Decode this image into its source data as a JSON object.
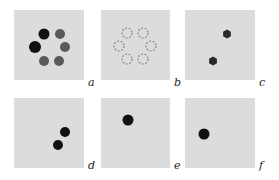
{
  "figure": {
    "background": "#ffffff",
    "panel_color": "#dcdcdc",
    "colors": {
      "dark": "#111111",
      "gray": "#5a5a5a",
      "outline": "#8a8a8a"
    },
    "panels": [
      {
        "id": "a",
        "label": "a",
        "x": 14,
        "y": 10,
        "w": 70,
        "h": 70,
        "label_x": 88,
        "label_y": 77,
        "dots": [
          {
            "cx": 30,
            "cy": 24,
            "r": 5.5,
            "style": "dark"
          },
          {
            "cx": 46,
            "cy": 24,
            "r": 5,
            "style": "gray"
          },
          {
            "cx": 21,
            "cy": 37,
            "r": 6,
            "style": "dark"
          },
          {
            "cx": 51,
            "cy": 37,
            "r": 5,
            "style": "gray"
          },
          {
            "cx": 30,
            "cy": 51,
            "r": 5,
            "style": "gray"
          },
          {
            "cx": 45,
            "cy": 51,
            "r": 5,
            "style": "gray"
          }
        ]
      },
      {
        "id": "b",
        "label": "b",
        "x": 101,
        "y": 10,
        "w": 69,
        "h": 70,
        "label_x": 174,
        "label_y": 77,
        "dots": [
          {
            "cx": 26,
            "cy": 23,
            "r": 5,
            "style": "dashed"
          },
          {
            "cx": 42,
            "cy": 23,
            "r": 5,
            "style": "dashed"
          },
          {
            "cx": 18,
            "cy": 36,
            "r": 5,
            "style": "dashed"
          },
          {
            "cx": 50,
            "cy": 36,
            "r": 5,
            "style": "dashed"
          },
          {
            "cx": 26,
            "cy": 49,
            "r": 5,
            "style": "dashed"
          },
          {
            "cx": 42,
            "cy": 49,
            "r": 5,
            "style": "dashed"
          }
        ]
      },
      {
        "id": "c",
        "label": "c",
        "x": 185,
        "y": 10,
        "w": 70,
        "h": 70,
        "label_x": 259,
        "label_y": 77,
        "dots": [
          {
            "cx": 42,
            "cy": 24,
            "r": 4.5,
            "style": "hex"
          },
          {
            "cx": 28,
            "cy": 51,
            "r": 4.5,
            "style": "hex"
          }
        ]
      },
      {
        "id": "d",
        "label": "d",
        "x": 14,
        "y": 98,
        "w": 70,
        "h": 70,
        "label_x": 88,
        "label_y": 160,
        "dots": [
          {
            "cx": 51,
            "cy": 34,
            "r": 5,
            "style": "dark"
          },
          {
            "cx": 44,
            "cy": 47,
            "r": 5,
            "style": "dark"
          }
        ]
      },
      {
        "id": "e",
        "label": "e",
        "x": 101,
        "y": 98,
        "w": 69,
        "h": 70,
        "label_x": 174,
        "label_y": 160,
        "dots": [
          {
            "cx": 27,
            "cy": 22,
            "r": 5.5,
            "style": "dark"
          }
        ]
      },
      {
        "id": "f",
        "label": "f",
        "x": 185,
        "y": 98,
        "w": 70,
        "h": 70,
        "label_x": 259,
        "label_y": 160,
        "dots": [
          {
            "cx": 19,
            "cy": 36,
            "r": 5.5,
            "style": "dark"
          }
        ]
      }
    ]
  }
}
